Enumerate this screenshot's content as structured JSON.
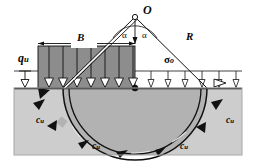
{
  "figure": {
    "name": "bearing-capacity-circular-slip-surface-diagram",
    "type": "engineering-diagram",
    "background_color": "#ffffff"
  },
  "labels": {
    "center_point": "O",
    "footing_width": "B",
    "radius": "R",
    "ultimate_bearing_pressure": "q",
    "ultimate_bearing_pressure_sub": "u",
    "surcharge": "σ",
    "surcharge_sub": "o",
    "angle_left": "α",
    "angle_right": "α",
    "undrained_shear_strength": "c",
    "undrained_shear_strength_sub": "u"
  },
  "cohesion_labels": [
    {
      "id": "cu-left-upper",
      "text": "c",
      "sub": "u"
    },
    {
      "id": "cu-bottom-left",
      "text": "c",
      "sub": "u"
    },
    {
      "id": "cu-bottom-right",
      "text": "c",
      "sub": "u"
    },
    {
      "id": "cu-right-upper",
      "text": "c",
      "sub": "u"
    }
  ],
  "colors": {
    "soil_outer": "#cfcfcf",
    "soil_slip_zone": "#b4b4b4",
    "load_block": "#8d8d8d",
    "line": "#111111",
    "white": "#ffffff",
    "border": "#9a9a9a"
  },
  "geometry": {
    "center_O": [
      135,
      17
    ],
    "footing_left_x": 38,
    "footing_right_x": 135,
    "ground_surface_y": 88,
    "arc_radius": 72,
    "block_top_y": 46,
    "surface_datum_y": 71
  },
  "load_arrow_count": 7,
  "surcharge_arrow_count": 6
}
